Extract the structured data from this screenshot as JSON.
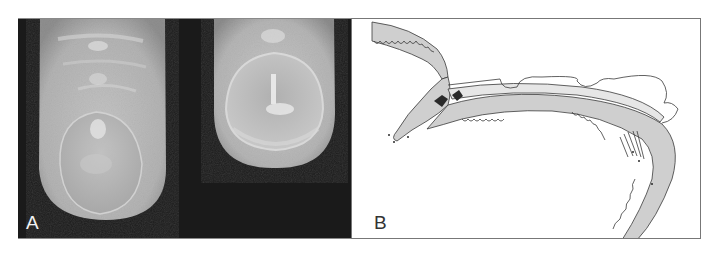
{
  "figure": {
    "panels": [
      {
        "id": "A",
        "label": "A",
        "content": "photograph of two fingertips viewed from the dorsal side showing nails"
      },
      {
        "id": "B",
        "label": "B",
        "content": "line drawing of longitudinal section through nail apparatus"
      }
    ]
  },
  "colors": {
    "photo_background": "#1a1a1a",
    "skin_tone": "#b9b9b9",
    "drawing_line": "#3a3a3a",
    "drawing_fill": "#cfcfcf",
    "frame_border": "#777777"
  }
}
